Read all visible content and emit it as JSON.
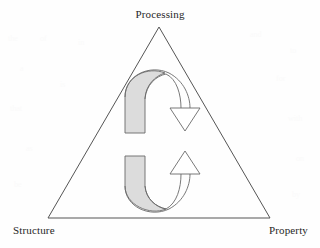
{
  "figure": {
    "type": "triangle-cycle-diagram",
    "background_color": "#fefefe",
    "line_color": "#555555",
    "arrow_fill_color": "#d9d9d9",
    "arrowhead_fill_color": "#ffffff",
    "text_color": "#272727"
  },
  "labels": {
    "apex": "Processing",
    "bottom_left": "Structure",
    "bottom_right": "Property"
  },
  "triangle": {
    "apex_x": 159,
    "apex_y": 27,
    "bottom_left_x": 48,
    "bottom_left_y": 218,
    "bottom_right_x": 270,
    "bottom_right_y": 218
  },
  "arrows": [
    {
      "name": "upper-clockwise-arrow",
      "direction": "down-right",
      "head_tip_x": 185,
      "head_tip_y": 130,
      "tail_x": 133,
      "tail_y": 133
    },
    {
      "name": "lower-counterclockwise-arrow",
      "direction": "up-right",
      "head_tip_x": 185,
      "head_tip_y": 151,
      "tail_x": 133,
      "tail_y": 156
    }
  ],
  "ghost_marks": [
    {
      "text": "the",
      "x": 8,
      "y": 40
    },
    {
      "text": "of",
      "x": 40,
      "y": 40
    },
    {
      "text": "in",
      "x": 78,
      "y": 44
    },
    {
      "text": "and",
      "x": 250,
      "y": 36
    },
    {
      "text": "to",
      "x": 290,
      "y": 52
    },
    {
      "text": "a",
      "x": 20,
      "y": 70
    },
    {
      "text": "is",
      "x": 60,
      "y": 86
    },
    {
      "text": "for",
      "x": 276,
      "y": 80
    },
    {
      "text": "that",
      "x": 10,
      "y": 110
    },
    {
      "text": "with",
      "x": 288,
      "y": 120
    },
    {
      "text": "as",
      "x": 26,
      "y": 150
    },
    {
      "text": "on",
      "x": 296,
      "y": 160
    },
    {
      "text": "be",
      "x": 14,
      "y": 186
    },
    {
      "text": "by",
      "x": 292,
      "y": 196
    }
  ]
}
